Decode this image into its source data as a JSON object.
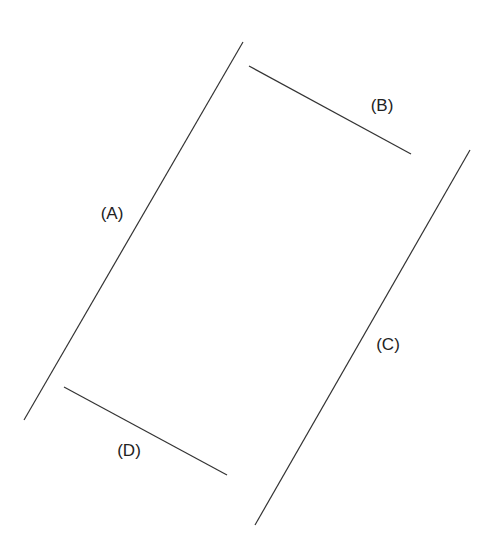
{
  "diagram": {
    "lines": [
      {
        "id": "A",
        "label": "(A)",
        "x1": 243,
        "y1": 42,
        "x2": 24,
        "y2": 420,
        "lx": 112,
        "ly": 219
      },
      {
        "id": "B",
        "label": "(B)",
        "x1": 249,
        "y1": 66,
        "x2": 411,
        "y2": 154,
        "lx": 382,
        "ly": 111
      },
      {
        "id": "C",
        "label": "(C)",
        "x1": 470,
        "y1": 150,
        "x2": 255,
        "y2": 525,
        "lx": 388,
        "ly": 350
      },
      {
        "id": "D",
        "label": "(D)",
        "x1": 64,
        "y1": 387,
        "x2": 227,
        "y2": 475,
        "lx": 129,
        "ly": 456
      }
    ],
    "line_color": "#333333",
    "background": "#ffffff"
  }
}
